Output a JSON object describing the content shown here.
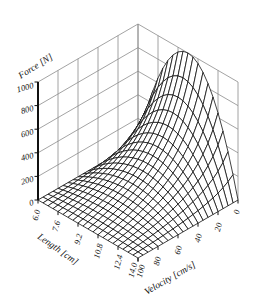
{
  "chart_data": {
    "type": "surface",
    "title": "",
    "xlabel": "Length [cm]",
    "ylabel": "Velocity [cm/s]",
    "zlabel": "Force [N]",
    "x_ticks": [
      "6.0",
      "7.6",
      "9.2",
      "10.8",
      "12.4",
      "14.0"
    ],
    "y_ticks": [
      "100",
      "80",
      "60",
      "40",
      "20",
      "0"
    ],
    "z_ticks": [
      "0",
      "200",
      "400",
      "600",
      "800",
      "1000"
    ],
    "xlim": [
      6.0,
      14.0
    ],
    "ylim": [
      0,
      100
    ],
    "zlim": [
      0,
      1000
    ],
    "x": [
      6.0,
      7.6,
      9.2,
      10.8,
      12.4,
      14.0
    ],
    "y": [
      0,
      20,
      40,
      60,
      80,
      100
    ],
    "z": [
      [
        0,
        0,
        0,
        0,
        0,
        0
      ],
      [
        640,
        307,
        165,
        85,
        35,
        0
      ],
      [
        960,
        461,
        247,
        128,
        52,
        0
      ],
      [
        960,
        461,
        247,
        128,
        52,
        0
      ],
      [
        640,
        307,
        165,
        85,
        35,
        0
      ],
      [
        0,
        0,
        0,
        0,
        0,
        0
      ]
    ],
    "model": {
      "F_max": 1000,
      "L_opt": 10.0,
      "L_half_width": 4.0,
      "V_max": 100,
      "hill_a": 0.3
    },
    "mesh": {
      "x_steps": 20,
      "y_steps": 20
    },
    "grid": true,
    "colors": {
      "mesh": "#111111",
      "wall_grid": "#8c8c8c",
      "background": "#ffffff"
    }
  }
}
